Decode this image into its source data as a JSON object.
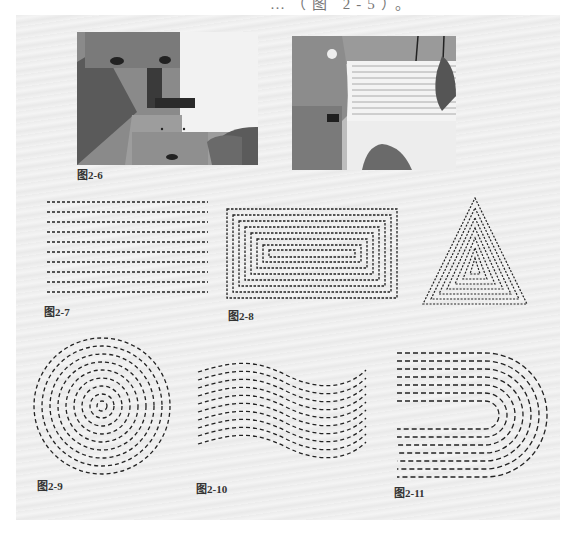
{
  "header": {
    "partial_text": "…（图 2-5）。"
  },
  "figures": [
    {
      "id": "fig-2-6",
      "label": "图2-6",
      "type": "photos",
      "description": [
        "sewing machine foot over fabric",
        "stitched parallel lines on fabric under sewing machine"
      ]
    },
    {
      "id": "fig-2-7",
      "label": "图2-7",
      "type": "parallel-lines",
      "rows": 10
    },
    {
      "id": "fig-2-8",
      "label": "图2-8",
      "type": "concentric-rectangles",
      "rings": 8
    },
    {
      "id": "fig-2-9",
      "label": "图2-9",
      "type": "concentric-circles",
      "rings": 8
    },
    {
      "id": "fig-2-10",
      "label": "图2-10",
      "type": "wave-lines",
      "rows": 10
    },
    {
      "id": "fig-2-11",
      "label": "图2-11",
      "type": "u-shape-lines",
      "rows": 7
    }
  ],
  "colors": {
    "stitch": "#222222",
    "page": "#eeeeee"
  }
}
